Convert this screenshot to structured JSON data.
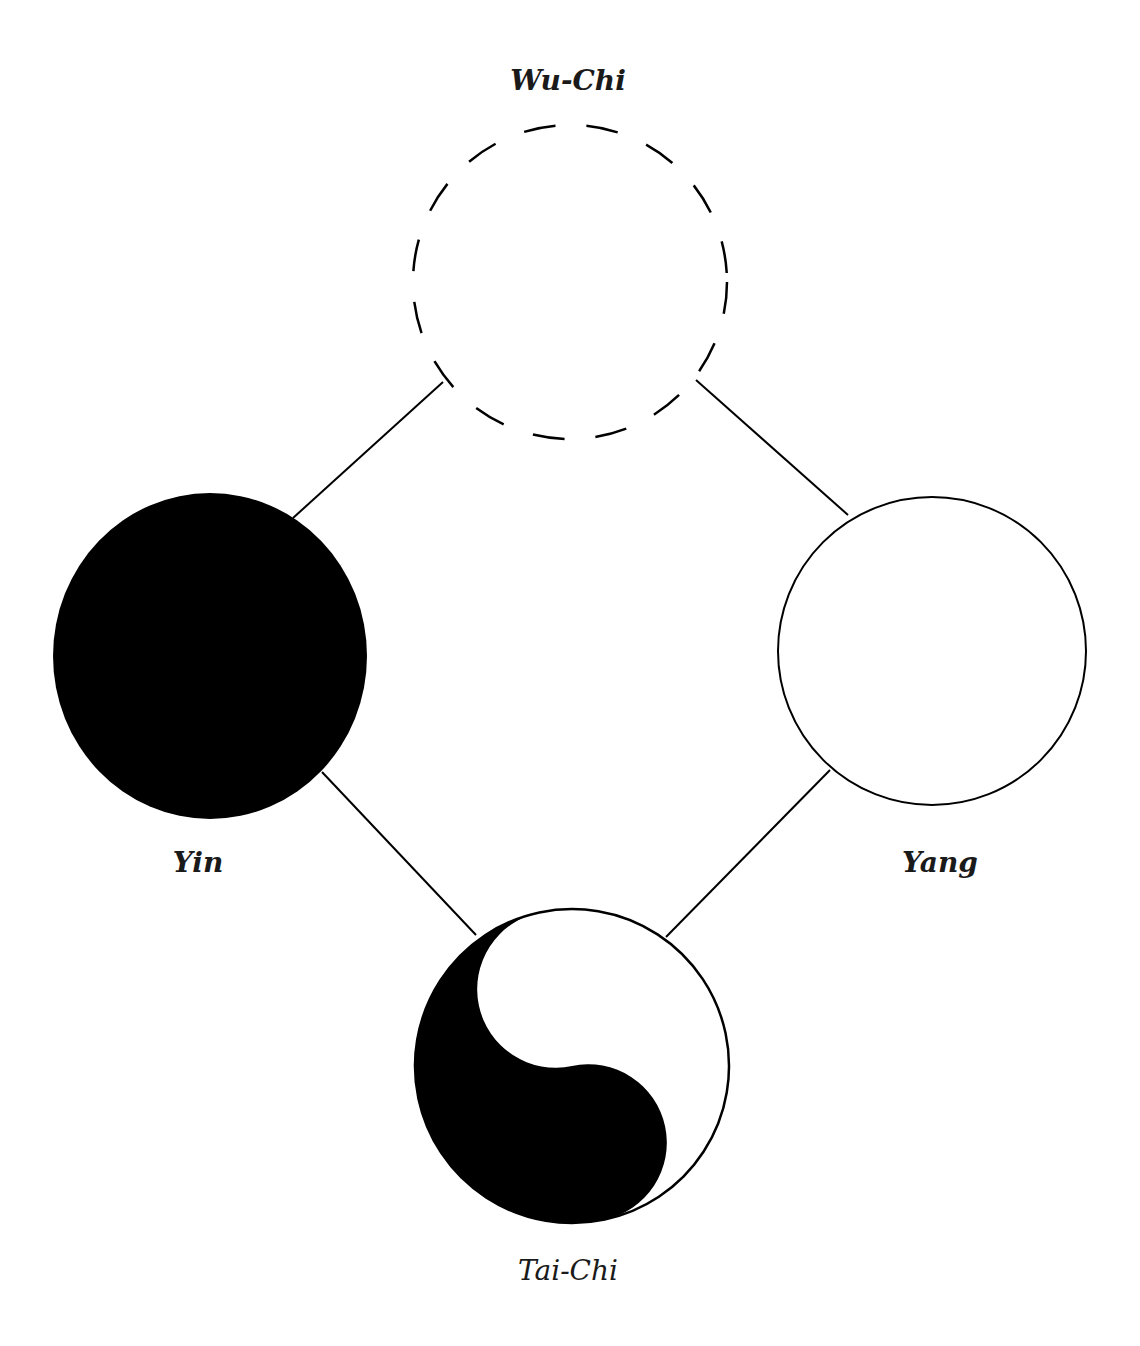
{
  "diagram": {
    "type": "concept-diagram",
    "nodes": [
      {
        "id": "wu-chi",
        "label": "Wu-Chi",
        "style": "dashed-outline-circle"
      },
      {
        "id": "yin",
        "label": "Yin",
        "style": "filled-black-circle"
      },
      {
        "id": "yang",
        "label": "Yang",
        "style": "outline-white-circle"
      },
      {
        "id": "tai-chi",
        "label": "Tai-Chi",
        "style": "yin-yang-symbol"
      }
    ],
    "edges": [
      {
        "from": "wu-chi",
        "to": "yin"
      },
      {
        "from": "wu-chi",
        "to": "yang"
      },
      {
        "from": "yin",
        "to": "tai-chi"
      },
      {
        "from": "yang",
        "to": "tai-chi"
      }
    ]
  },
  "labels": {
    "wu_chi": "Wu-Chi",
    "yin": "Yin",
    "yang": "Yang",
    "tai_chi": "Tai-Chi"
  },
  "colors": {
    "ink": "#000000",
    "paper": "#ffffff"
  }
}
